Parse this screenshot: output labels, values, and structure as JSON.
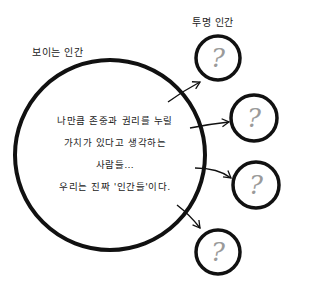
{
  "labels": {
    "visible_human": "보이는 인간",
    "invisible_human": "투명 인간"
  },
  "body_text": [
    "나만큼 존중과 권리를 누릴",
    "가치가 있다고 생각하는",
    "사람들…",
    "우리는 진짜 '인간들'이다."
  ],
  "unknown_symbol": "?",
  "colors": {
    "stroke": "#111111",
    "question": "#9a9a9a",
    "background": "#ffffff"
  }
}
